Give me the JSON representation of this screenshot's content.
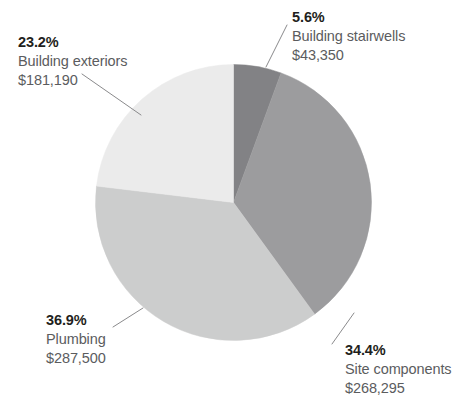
{
  "chart_data": {
    "type": "pie",
    "title": "",
    "subtitle": "",
    "xlabel": "",
    "ylabel": "",
    "legend_position": "none",
    "grid": false,
    "start_angle_deg": 0,
    "direction": "clockwise",
    "total_value": 780335,
    "value_prefix": "$",
    "categories": [
      "Building stairwells",
      "Site components",
      "Plumbing",
      "Building exteriors"
    ],
    "values": [
      43350,
      268295,
      287500,
      181190
    ],
    "percentages": [
      5.6,
      34.4,
      36.9,
      23.2
    ],
    "slices": [
      {
        "label": "Building stairwells",
        "percent_text": "5.6%",
        "percent": 5.6,
        "value": 43350,
        "value_text": "$43,350",
        "color": "#828285",
        "start_deg": 0,
        "end_deg": 20.16
      },
      {
        "label": "Site components",
        "percent_text": "34.4%",
        "percent": 34.4,
        "value": 268295,
        "value_text": "$268,295",
        "color": "#9c9c9e",
        "start_deg": 20.16,
        "end_deg": 144.0
      },
      {
        "label": "Plumbing",
        "percent_text": "36.9%",
        "percent": 36.9,
        "value": 287500,
        "value_text": "$287,500",
        "color": "#cccdcd",
        "start_deg": 144.0,
        "end_deg": 276.84
      },
      {
        "label": "Building exteriors",
        "percent_text": "23.2%",
        "percent": 23.2,
        "value": 181190,
        "value_text": "$181,190",
        "color": "#ebebeb",
        "start_deg": 276.84,
        "end_deg": 360.0
      }
    ]
  },
  "colors": {
    "background": "#ffffff",
    "percent_text": "#1f1f20",
    "label_text": "#5b5c5e",
    "leader_line": "#8a8a8c",
    "slice_stairwells": "#828285",
    "slice_site_components": "#9c9c9e",
    "slice_plumbing": "#cccdcd",
    "slice_building_exteriors": "#ebebeb"
  },
  "labels": {
    "building_exteriors": {
      "percent": "23.2%",
      "category": "Building exteriors",
      "amount": "$181,190"
    },
    "building_stairwells": {
      "percent": "5.6%",
      "category": "Building stairwells",
      "amount": "$43,350"
    },
    "site_components": {
      "percent": "34.4%",
      "category": "Site components",
      "amount": "$268,295"
    },
    "plumbing": {
      "percent": "36.9%",
      "category": "Plumbing",
      "amount": "$287,500"
    }
  }
}
